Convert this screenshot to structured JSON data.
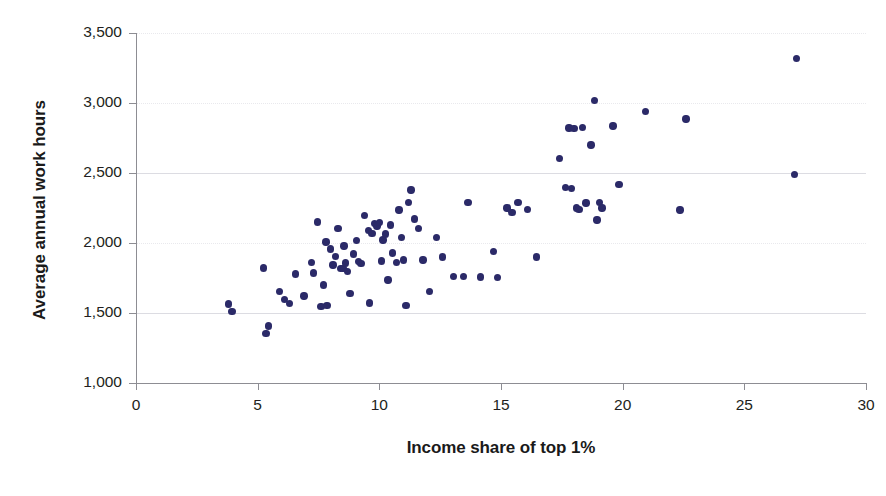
{
  "chart_data": {
    "type": "scatter",
    "title": "",
    "xlabel": "Income share of top 1%",
    "ylabel": "Average annual work hours",
    "xlim": [
      0,
      30
    ],
    "ylim": [
      1000,
      3500
    ],
    "xticks": [
      0,
      5,
      10,
      15,
      20,
      25,
      30
    ],
    "xtick_labels": [
      "0",
      "5",
      "10",
      "15",
      "20",
      "25",
      "30"
    ],
    "yticks": [
      1000,
      1500,
      2000,
      2500,
      3000,
      3500
    ],
    "ytick_labels": [
      "1,000",
      "1,500",
      "2,000",
      "2,500",
      "3,000",
      "3,500"
    ],
    "grid": "horizontal",
    "legend": "none",
    "marker_color": "#2b2a68",
    "axis_color": "#8d8d93",
    "gridline_color": "#e9e9ed",
    "background": "#ffffff",
    "points": [
      [
        3.8,
        1565
      ],
      [
        3.95,
        1512
      ],
      [
        5.25,
        1822
      ],
      [
        5.35,
        1355
      ],
      [
        5.45,
        1408
      ],
      [
        5.9,
        1652
      ],
      [
        6.1,
        1598
      ],
      [
        6.3,
        1568
      ],
      [
        6.55,
        1778
      ],
      [
        6.9,
        1622
      ],
      [
        7.2,
        1862
      ],
      [
        7.3,
        1785
      ],
      [
        7.45,
        2150
      ],
      [
        7.6,
        1548
      ],
      [
        7.7,
        1700
      ],
      [
        7.8,
        2006
      ],
      [
        7.85,
        1552
      ],
      [
        8.0,
        1958
      ],
      [
        8.1,
        1842
      ],
      [
        8.2,
        1905
      ],
      [
        8.3,
        2105
      ],
      [
        8.4,
        1820
      ],
      [
        8.5,
        1820
      ],
      [
        8.55,
        1980
      ],
      [
        8.6,
        1858
      ],
      [
        8.7,
        1795
      ],
      [
        8.8,
        1638
      ],
      [
        8.95,
        1922
      ],
      [
        9.05,
        2016
      ],
      [
        9.15,
        1868
      ],
      [
        9.25,
        1852
      ],
      [
        9.4,
        2198
      ],
      [
        9.55,
        2090
      ],
      [
        9.6,
        1572
      ],
      [
        9.7,
        2070
      ],
      [
        9.8,
        2140
      ],
      [
        9.9,
        2122
      ],
      [
        10.0,
        2148
      ],
      [
        10.1,
        1872
      ],
      [
        10.15,
        2022
      ],
      [
        10.25,
        2065
      ],
      [
        10.35,
        1735
      ],
      [
        10.45,
        2128
      ],
      [
        10.55,
        1930
      ],
      [
        10.7,
        1862
      ],
      [
        10.8,
        2235
      ],
      [
        10.9,
        2040
      ],
      [
        11.0,
        1878
      ],
      [
        11.1,
        1552
      ],
      [
        11.2,
        2290
      ],
      [
        11.3,
        2378
      ],
      [
        11.45,
        2172
      ],
      [
        11.6,
        2102
      ],
      [
        11.8,
        1878
      ],
      [
        12.05,
        1655
      ],
      [
        12.35,
        2040
      ],
      [
        12.6,
        1900
      ],
      [
        13.05,
        1762
      ],
      [
        13.45,
        1760
      ],
      [
        13.65,
        2290
      ],
      [
        14.15,
        1758
      ],
      [
        14.7,
        1938
      ],
      [
        14.85,
        1755
      ],
      [
        15.25,
        2250
      ],
      [
        15.45,
        2220
      ],
      [
        15.7,
        2290
      ],
      [
        16.1,
        2240
      ],
      [
        16.45,
        1900
      ],
      [
        17.4,
        2605
      ],
      [
        17.65,
        2395
      ],
      [
        17.8,
        2822
      ],
      [
        17.9,
        2390
      ],
      [
        18.0,
        2820
      ],
      [
        18.1,
        2250
      ],
      [
        18.2,
        2240
      ],
      [
        18.35,
        2825
      ],
      [
        18.5,
        2285
      ],
      [
        18.7,
        2700
      ],
      [
        18.85,
        3020
      ],
      [
        18.95,
        2165
      ],
      [
        19.05,
        2290
      ],
      [
        19.15,
        2250
      ],
      [
        19.6,
        2835
      ],
      [
        19.85,
        2420
      ],
      [
        20.95,
        2940
      ],
      [
        22.35,
        2235
      ],
      [
        22.6,
        2885
      ],
      [
        27.05,
        2490
      ],
      [
        27.15,
        3320
      ]
    ]
  }
}
